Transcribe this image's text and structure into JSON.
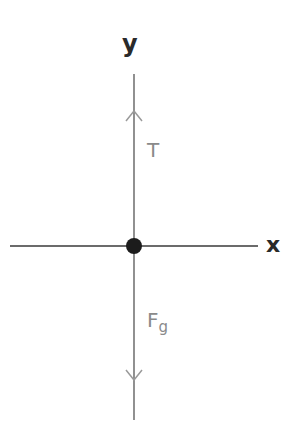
{
  "diagram": {
    "axes": {
      "x_label": "x",
      "y_label": "y"
    },
    "forces": [
      {
        "name": "tension",
        "label": "T",
        "direction": "up"
      },
      {
        "name": "gravity",
        "label": "F",
        "subscript": "g",
        "direction": "down"
      }
    ],
    "object": "point-mass",
    "colors": {
      "axis": "#3a3a3a",
      "force": "#9a9a9a",
      "dot": "#1c1c1c",
      "label": "#8a8a8a"
    }
  }
}
